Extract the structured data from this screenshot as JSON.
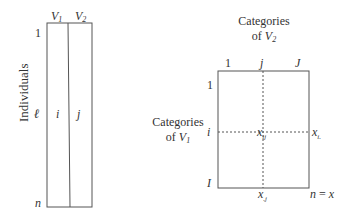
{
  "left_table": {
    "axis_label": "Individuals",
    "column_headers": [
      "V1",
      "V2"
    ],
    "column_header_parts": [
      {
        "base": "V",
        "sub": "1"
      },
      {
        "base": "V",
        "sub": "2"
      }
    ],
    "row_labels": {
      "first": "1",
      "middle": "ℓ",
      "last": "n"
    },
    "cell_values": [
      "i",
      "j"
    ]
  },
  "right_table": {
    "top_title_line1": "Categories",
    "top_title_line2_prefix": "of ",
    "top_title_var": {
      "base": "V",
      "sub": "2"
    },
    "left_title_line1": "Categories",
    "left_title_line2_prefix": "of ",
    "left_title_var": {
      "base": "V",
      "sub": "1"
    },
    "column_labels": {
      "first": "1",
      "middle": "j",
      "last": "J"
    },
    "row_labels": {
      "first": "1",
      "middle": "i",
      "last": "I"
    },
    "cell_value": {
      "base": "x",
      "sub": "ij"
    },
    "row_margin": {
      "base": "x",
      "sub": "i."
    },
    "column_margin": {
      "base": "x",
      "sub": ".j"
    },
    "total": {
      "lhs": "n",
      "eq": " = ",
      "rhs": "x"
    }
  },
  "colors": {
    "line": "#555555",
    "text": "#333333",
    "background": "#ffffff"
  }
}
